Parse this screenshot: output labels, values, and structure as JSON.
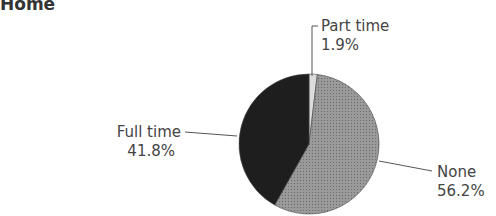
{
  "chart_data": {
    "type": "pie",
    "title": "Home",
    "slices": [
      {
        "label": "Part time",
        "value": 1.9,
        "display": "1.9%",
        "fill": "#dcdcdc"
      },
      {
        "label": "None",
        "value": 56.2,
        "display": "56.2%",
        "fill": "#8a8a8a"
      },
      {
        "label": "Full time",
        "value": 41.8,
        "display": "41.8%",
        "fill": "#1e1e1e"
      }
    ],
    "start": "12 o'clock, clockwise"
  }
}
